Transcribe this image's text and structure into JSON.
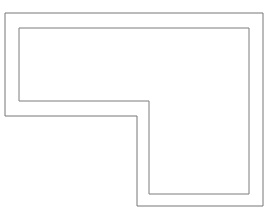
{
  "canvas": {
    "width": 272,
    "height": 216,
    "background_color": "#ffffff",
    "description": "Technical line drawing of a double-outlined L-shaped polygon"
  },
  "drawing": {
    "title": "L-shaped outline",
    "stroke_color": "#767676",
    "stroke_color_inner": "#7d7d7d",
    "stroke_width": 1,
    "fill": "none",
    "shape_type": "L-shaped hexagonal polygon (6 vertices)",
    "paths": [
      {
        "name": "outer-outline",
        "label": "Outer L outline",
        "stroke": "#767676",
        "stroke_width": 1,
        "vertices": [
          [
            5,
            13
          ],
          [
            263,
            13
          ],
          [
            263,
            206
          ],
          [
            137,
            206
          ],
          [
            137,
            116
          ],
          [
            5,
            116
          ]
        ],
        "d": "M 5 13 L 263 13 L 263 206 L 137 206 L 137 116 L 5 116 Z"
      },
      {
        "name": "inner-outline",
        "label": "Inner L outline",
        "stroke": "#7d7d7d",
        "stroke_width": 1,
        "vertices": [
          [
            19,
            28
          ],
          [
            249,
            28
          ],
          [
            249,
            194
          ],
          [
            149,
            194
          ],
          [
            149,
            101
          ],
          [
            19,
            101
          ]
        ],
        "d": "M 19 28 L 249 28 L 249 194 L 149 194 L 149 101 L 19 101 Z"
      }
    ],
    "measurements": {
      "outer_width": 258,
      "outer_height": 193,
      "inner_width": 230,
      "inner_height": 166,
      "wall_thickness_top": 15,
      "wall_thickness_left": 14,
      "wall_thickness_right": 14,
      "wall_thickness_bottom": 12,
      "notch_corner_outer": [
        137,
        116
      ],
      "notch_corner_inner": [
        149,
        101
      ]
    }
  }
}
